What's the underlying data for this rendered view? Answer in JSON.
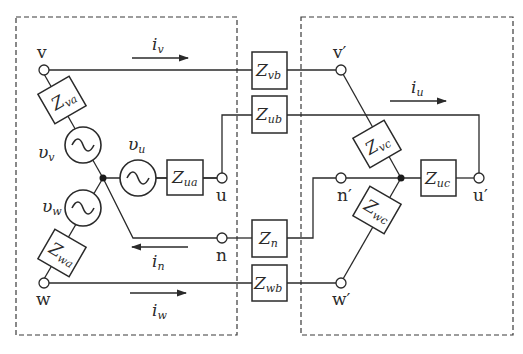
{
  "diagram": {
    "type": "three-phase four-wire circuit",
    "left_box": {
      "terminals": {
        "v": "v",
        "u": "u",
        "n": "n",
        "w": "w"
      },
      "sources": {
        "v": "υ",
        "v_sub": "v",
        "u": "υ",
        "u_sub": "u",
        "w": "υ",
        "w_sub": "w"
      },
      "impedances": {
        "va": {
          "main": "Z",
          "sub": "va"
        },
        "ua": {
          "main": "Z",
          "sub": "ua"
        },
        "wa": {
          "main": "Z",
          "sub": "wa"
        }
      }
    },
    "line": {
      "impedances": {
        "vb": {
          "main": "Z",
          "sub": "vb"
        },
        "ub": {
          "main": "Z",
          "sub": "ub"
        },
        "n": {
          "main": "Z",
          "sub": "n"
        },
        "wb": {
          "main": "Z",
          "sub": "wb"
        }
      },
      "currents": {
        "iv": {
          "main": "i",
          "sub": "v"
        },
        "iu": {
          "main": "i",
          "sub": "u"
        },
        "in": {
          "main": "i",
          "sub": "n"
        },
        "iw": {
          "main": "i",
          "sub": "w"
        }
      }
    },
    "right_box": {
      "terminals": {
        "v": "v′",
        "n": "n′",
        "u": "u′",
        "w": "w′"
      },
      "impedances": {
        "vc": {
          "main": "Z",
          "sub": "vc"
        },
        "uc": {
          "main": "Z",
          "sub": "uc"
        },
        "wc": {
          "main": "Z",
          "sub": "wc"
        }
      }
    },
    "colors": {
      "stroke": "#2a2a2a",
      "background": "#ffffff"
    }
  }
}
